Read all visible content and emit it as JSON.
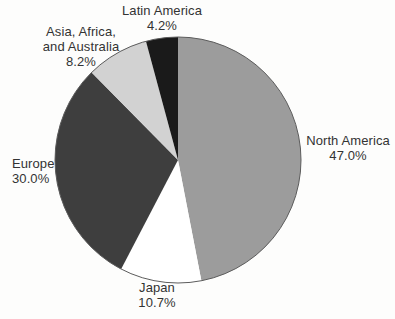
{
  "chart_data": {
    "type": "pie",
    "title": "",
    "direction": "clockwise",
    "start_angle_deg": 0,
    "legend_position": "none",
    "labels_outside": true,
    "background": "#fdfdfc",
    "outline_color": "#5c5c5c",
    "text_color": "#333333",
    "categories": [
      "North America",
      "Japan",
      "Europe",
      "Asia, Africa, and Australia",
      "Latin America"
    ],
    "values": [
      47.0,
      10.7,
      30.0,
      8.2,
      4.2
    ],
    "slices": [
      {
        "label": "North America",
        "label_lines": [
          "North America"
        ],
        "pct_label": "47.0%",
        "value": 47.0,
        "color": "#9c9c9c"
      },
      {
        "label": "Japan",
        "label_lines": [
          "Japan"
        ],
        "pct_label": "10.7%",
        "value": 10.7,
        "color": "#ffffff"
      },
      {
        "label": "Europe",
        "label_lines": [
          "Europe"
        ],
        "pct_label": "30.0%",
        "value": 30.0,
        "color": "#3e3e3e"
      },
      {
        "label": "Asia, Africa, and Australia",
        "label_lines": [
          "Asia, Africa,",
          "and Australia"
        ],
        "pct_label": "8.2%",
        "value": 8.2,
        "color": "#d2d2d2"
      },
      {
        "label": "Latin America",
        "label_lines": [
          "Latin America"
        ],
        "pct_label": "4.2%",
        "value": 4.2,
        "color": "#1a1a1a"
      }
    ],
    "geometry": {
      "cx": 178,
      "cy": 160,
      "r": 123
    }
  }
}
